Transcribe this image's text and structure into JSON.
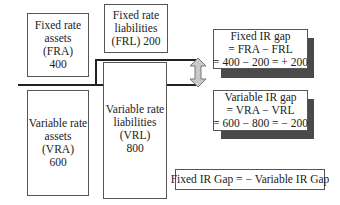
{
  "diagram": {
    "fixed_assets": {
      "lines": [
        "Fixed rate",
        "assets",
        "(FRA)",
        "400"
      ]
    },
    "fixed_liabilities": {
      "lines": [
        "Fixed rate",
        "liabilities",
        "(FRL) 200"
      ]
    },
    "variable_assets": {
      "lines": [
        "Variable rate",
        "assets",
        "(VRA)",
        "600"
      ]
    },
    "variable_liabilities": {
      "lines": [
        "Variable rate",
        "liabilities",
        "(VRL)",
        "800"
      ]
    },
    "fixed_gap": {
      "lines": [
        "Fixed IR gap",
        "= FRA − FRL",
        "= 400 − 200 = + 200"
      ]
    },
    "variable_gap": {
      "lines": [
        "Variable IR gap",
        "= VRA − VRL",
        "= 600 − 800 = − 200"
      ]
    },
    "identity": {
      "text": "Fixed IR Gap = − Variable IR Gap"
    },
    "arrow_icon": "double-vertical-arrow",
    "colors": {
      "shadow": "#4a4a4a",
      "arrow_fill": "#c8c8c8",
      "line": "#222222"
    }
  }
}
